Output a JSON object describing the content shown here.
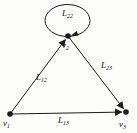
{
  "figure": {
    "type": "directed-graph-diagram",
    "colors": {
      "line": "#1c1c1c",
      "text": "#111111",
      "background": "#fdfdfc"
    },
    "nodes": [
      {
        "id": "v1",
        "label": "v",
        "subscript": "1",
        "position": "bottom-left"
      },
      {
        "id": "v2",
        "label": "v",
        "subscript": "2",
        "position": "top"
      },
      {
        "id": "v3",
        "label": "v",
        "subscript": "3",
        "position": "bottom-right"
      }
    ],
    "edges": [
      {
        "from": "v1",
        "to": "v2",
        "label": "L",
        "subscript": "12",
        "kind": "straight"
      },
      {
        "from": "v2",
        "to": "v3",
        "label": "L",
        "subscript": "23",
        "kind": "straight"
      },
      {
        "from": "v1",
        "to": "v3",
        "label": "L",
        "subscript": "13",
        "kind": "straight"
      },
      {
        "from": "v2",
        "to": "v2",
        "label": "L",
        "subscript": "22",
        "kind": "self-loop"
      }
    ]
  }
}
